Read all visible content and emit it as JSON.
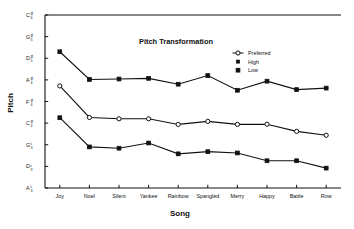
{
  "chart_data": {
    "type": "line",
    "title": "Pitch Transformation",
    "xlabel": "Song",
    "ylabel": "Pitch",
    "grid": false,
    "legend_position": "top-right",
    "categories": [
      "Joy",
      "Noel",
      "Silent",
      "Yankee",
      "Rainbow",
      "Spangled",
      "Merry",
      "Happy",
      "Battle",
      "Row"
    ],
    "ytick_labels": [
      "A♭₃",
      "D♭₃",
      "G♭₃",
      "C♯₄",
      "F♯₄",
      "A♯₄",
      "D♯₅",
      "G♯₅",
      "C♯₆"
    ],
    "ytick_bases": [
      "A",
      "D",
      "G",
      "C",
      "F",
      "A",
      "D",
      "G",
      "C"
    ],
    "ytick_accidentals": [
      "♭",
      "♭",
      "♭",
      "♯",
      "♯",
      "♯",
      "♯",
      "♯",
      "♯"
    ],
    "ytick_octaves": [
      "3",
      "3",
      "3",
      "4",
      "4",
      "4",
      "5",
      "5",
      "6"
    ],
    "ytick_values": [
      0,
      1,
      2,
      3,
      4,
      5,
      6,
      7,
      8
    ],
    "ylim": [
      0,
      8
    ],
    "series": [
      {
        "name": "High",
        "marker": "filled-square",
        "values": [
          6.3,
          5.02,
          5.04,
          5.07,
          4.8,
          5.2,
          4.52,
          4.94,
          4.55,
          4.62
        ]
      },
      {
        "name": "Preferred",
        "marker": "open-circle",
        "values": [
          4.72,
          3.26,
          3.2,
          3.2,
          2.94,
          3.08,
          2.94,
          2.95,
          2.62,
          2.44
        ]
      },
      {
        "name": "Low",
        "marker": "filled-square",
        "values": [
          3.25,
          1.9,
          1.84,
          2.08,
          1.58,
          1.68,
          1.62,
          1.26,
          1.26,
          0.92
        ]
      }
    ],
    "legend_entries": [
      {
        "label": "Preferred",
        "marker": "open-circle"
      },
      {
        "label": "High",
        "marker": "filled-small"
      },
      {
        "label": "Low",
        "marker": "filled-square"
      }
    ],
    "colors": {
      "ink": "#111111",
      "background": "#ffffff"
    }
  }
}
